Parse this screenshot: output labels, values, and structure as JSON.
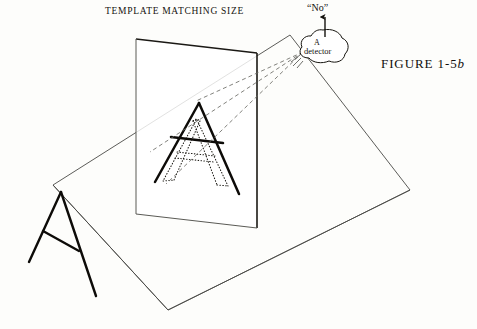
{
  "figure": {
    "title": "TEMPLATE MATCHING SIZE",
    "label_prefix": "FIGURE  1-5",
    "label_suffix": "b",
    "output_label": "“No”",
    "detector_line1": "A",
    "detector_line2": "detector",
    "background_color": "#fdfdfb",
    "ink_color": "#100e0b",
    "thin_line_color": "#4a4a46",
    "dashed_color": "#6b6b66"
  },
  "geometry": {
    "image_plane": {
      "name": "vertical-image-plane",
      "corners": [
        [
          136,
          39
        ],
        [
          257,
          53
        ],
        [
          257,
          228
        ],
        [
          136,
          214
        ]
      ]
    },
    "ground_plane": {
      "name": "slanted-ground-plane",
      "corners": [
        [
          53,
          185
        ],
        [
          290,
          35
        ],
        [
          410,
          190
        ],
        [
          168,
          310
        ]
      ]
    },
    "solid_letter_a": {
      "name": "projected-letter-a",
      "apex": [
        199,
        103
      ],
      "left_foot": [
        155,
        182
      ],
      "right_foot": [
        238,
        193
      ],
      "crossbar_left": [
        172,
        137
      ],
      "crossbar_right": [
        222,
        143
      ]
    },
    "dotted_letter_a": {
      "name": "template-letter-a",
      "apex": [
        196,
        120
      ],
      "left_foot": [
        166,
        178
      ],
      "right_foot": [
        224,
        186
      ],
      "crossbar_left": [
        178,
        155
      ],
      "crossbar_right": [
        214,
        159
      ]
    },
    "ground_letter_a": {
      "name": "scene-letter-a",
      "apex": [
        61,
        192
      ],
      "left_foot": [
        29,
        262
      ],
      "right_foot": [
        96,
        296
      ],
      "crossbar_left": [
        44,
        231
      ],
      "crossbar_right": [
        77,
        250
      ]
    },
    "detector_blob": {
      "name": "detector-cloud",
      "center": [
        323,
        47
      ],
      "ray_origin": [
        303,
        52
      ]
    },
    "rays": [
      {
        "name": "ray-to-apex",
        "to": [
          199,
          103
        ]
      },
      {
        "name": "ray-to-left-foot",
        "to": [
          155,
          182
        ]
      },
      {
        "name": "ray-to-right-foot",
        "to": [
          238,
          194
        ]
      }
    ],
    "output_arrow": {
      "name": "no-output-arrow",
      "from": [
        325,
        37
      ],
      "to": [
        325,
        16
      ]
    }
  }
}
